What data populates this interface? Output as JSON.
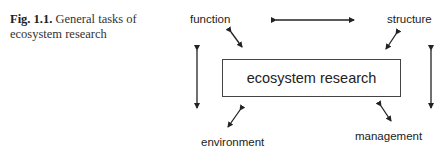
{
  "caption": {
    "figure_label": "Fig. 1.1.",
    "text": "General tasks of ecosystem research"
  },
  "diagram": {
    "center": "ecosystem research",
    "nodes": {
      "top_left": "function",
      "top_right": "structure",
      "bottom_left": "environment",
      "bottom_right": "management"
    },
    "connections": [
      {
        "from": "function",
        "to": "structure",
        "type": "bidirectional"
      },
      {
        "from": "function",
        "to": "ecosystem research",
        "type": "bidirectional"
      },
      {
        "from": "structure",
        "to": "ecosystem research",
        "type": "bidirectional"
      },
      {
        "from": "environment",
        "to": "ecosystem research",
        "type": "bidirectional"
      },
      {
        "from": "management",
        "to": "ecosystem research",
        "type": "bidirectional"
      },
      {
        "from": "function",
        "to": "environment",
        "type": "bidirectional"
      },
      {
        "from": "structure",
        "to": "management",
        "type": "bidirectional"
      }
    ]
  }
}
